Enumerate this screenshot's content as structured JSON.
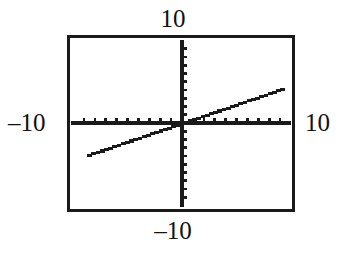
{
  "view": {
    "title": "graphing-calculator-viewport",
    "background_color": "#ffffff",
    "ink_color": "#1a1a1a",
    "frame_color": "#1a1a1a"
  },
  "labels": {
    "top": "10",
    "bottom": "–10",
    "left": "–10",
    "right": "10"
  },
  "chart_data": {
    "type": "line",
    "title": "",
    "xlabel": "",
    "ylabel": "",
    "xlim": [
      -10,
      10
    ],
    "ylim": [
      -10,
      10
    ],
    "xtick_labels": [
      "-10",
      "10"
    ],
    "ytick_labels": [
      "-10",
      "10"
    ],
    "xticks": [
      -9,
      -8,
      -7,
      -6,
      -5,
      -4,
      -3,
      -2,
      -1,
      1,
      2,
      3,
      4,
      5,
      6,
      7,
      8,
      9
    ],
    "yticks": [
      -9,
      -8,
      -7,
      -6,
      -5,
      -4,
      -3,
      -2,
      -1,
      1,
      2,
      3,
      4,
      5,
      6,
      7,
      8,
      9
    ],
    "grid": false,
    "legend": "none",
    "axes_style": "centered-crosshair-with-tickmarks",
    "series": [
      {
        "name": "line",
        "equation": "y = 0.45x",
        "slope": 0.45,
        "intercept": 0,
        "x": [
          -8.7,
          -7,
          -5,
          -3,
          -1,
          0,
          1,
          3,
          5,
          7,
          9.2
        ],
        "values": [
          -3.92,
          -3.15,
          -2.25,
          -1.35,
          -0.45,
          0,
          0.45,
          1.35,
          2.25,
          3.15,
          4.14
        ],
        "x_start": -8.7,
        "x_end": 9.2,
        "render": "pixelated-staircase"
      }
    ]
  }
}
